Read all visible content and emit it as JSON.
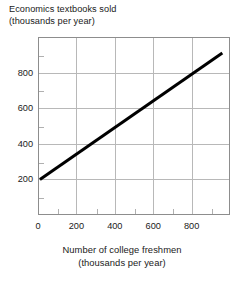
{
  "chart_data": {
    "type": "line",
    "title": "",
    "ylabel": "Economics textbooks sold (thousands per year)",
    "ylabel_lines": [
      "Economics textbooks sold",
      "(thousands per year)"
    ],
    "xlabel": "Number of college freshmen (thousands per year)",
    "xlabel_lines": [
      "Number of college freshmen",
      "(thousands per year)"
    ],
    "xlim": [
      0,
      1000
    ],
    "ylim": [
      0,
      1000
    ],
    "xticks": [
      0,
      200,
      400,
      600,
      800
    ],
    "yticks": [
      200,
      400,
      600,
      800
    ],
    "xtick_labels": [
      "0",
      "200",
      "400",
      "600",
      "800"
    ],
    "ytick_labels": [
      "200",
      "400",
      "600",
      "800"
    ],
    "xminor_ticks": [
      100,
      300,
      500,
      700,
      900
    ],
    "yminor_ticks": [
      100,
      300,
      500,
      700,
      900
    ],
    "grid": true,
    "grid_color": "#b8b8b8",
    "frame_color": "#8d8d8d",
    "legend": "none",
    "series": [
      {
        "name": "textbooks sold vs college freshmen",
        "color": "#000000",
        "linewidth": 3,
        "x": [
          10,
          960
        ],
        "y": [
          200,
          910
        ],
        "points": [
          {
            "x": 10,
            "y": 200
          },
          {
            "x": 200,
            "y": 342
          },
          {
            "x": 400,
            "y": 492
          },
          {
            "x": 600,
            "y": 641
          },
          {
            "x": 800,
            "y": 790
          },
          {
            "x": 960,
            "y": 910
          }
        ],
        "slope_per_unit": 0.747,
        "intercept": 193
      }
    ]
  },
  "ticks": {
    "y": [
      {
        "label": "800",
        "value": 800
      },
      {
        "label": "600",
        "value": 600
      },
      {
        "label": "400",
        "value": 400
      },
      {
        "label": "200",
        "value": 200
      }
    ],
    "x": [
      {
        "label": "0",
        "value": 0
      },
      {
        "label": "200",
        "value": 200
      },
      {
        "label": "400",
        "value": 400
      },
      {
        "label": "600",
        "value": 600
      },
      {
        "label": "800",
        "value": 800
      }
    ]
  },
  "colors": {
    "line": "#000000",
    "grid": "#b8b8b8",
    "frame": "#8d8d8d",
    "text": "#1a1a1a",
    "background": "#ffffff"
  }
}
